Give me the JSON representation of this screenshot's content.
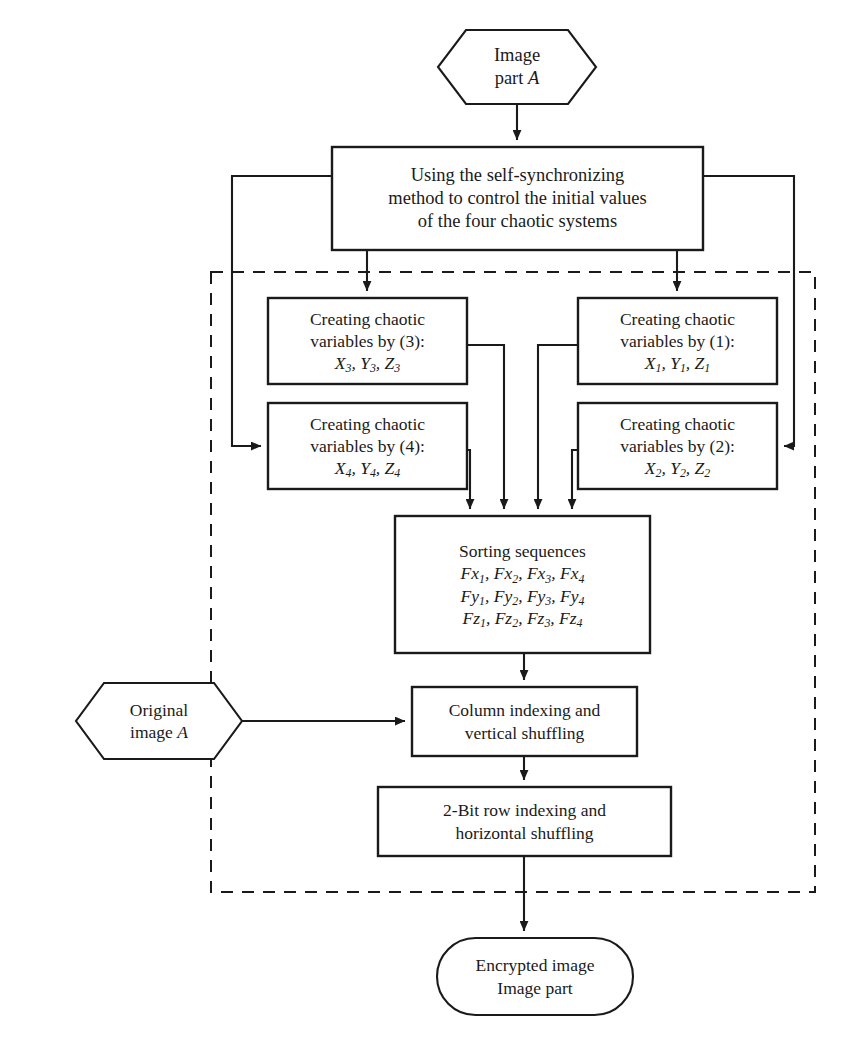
{
  "diagram": {
    "colors": {
      "stroke": "#1a1a1a",
      "background": "#ffffff",
      "dashed_region_stroke": "#1a1a1a"
    },
    "nodes": {
      "start_terminal": {
        "shape": "hexagon",
        "lines": [
          "Image",
          "part A"
        ],
        "line1": "Image",
        "line2_prefix": "part ",
        "line2_var": "A"
      },
      "sync_process": {
        "shape": "rectangle",
        "line1": "Using the self-synchronizing",
        "line2": "method to control the initial values",
        "line3": "of the four chaotic systems"
      },
      "chaotic_3": {
        "shape": "rectangle",
        "line1": "Creating chaotic",
        "line2": "variables by (3):",
        "vars": [
          "X",
          "Y",
          "Z"
        ],
        "index": "3"
      },
      "chaotic_1": {
        "shape": "rectangle",
        "line1": "Creating chaotic",
        "line2": "variables by (1):",
        "vars": [
          "X",
          "Y",
          "Z"
        ],
        "index": "1"
      },
      "chaotic_4": {
        "shape": "rectangle",
        "line1": "Creating chaotic",
        "line2": "variables by (4):",
        "vars": [
          "X",
          "Y",
          "Z"
        ],
        "index": "4"
      },
      "chaotic_2": {
        "shape": "rectangle",
        "line1": "Creating chaotic",
        "line2": "variables by (2):",
        "vars": [
          "X",
          "Y",
          "Z"
        ],
        "index": "2"
      },
      "sorting": {
        "shape": "rectangle",
        "heading": "Sorting sequences",
        "row_fx": {
          "prefix": "Fx",
          "indices": [
            "1",
            "2",
            "3",
            "4"
          ]
        },
        "row_fy": {
          "prefix": "Fy",
          "indices": [
            "1",
            "2",
            "3",
            "4"
          ]
        },
        "row_fz": {
          "prefix": "Fz",
          "indices": [
            "1",
            "2",
            "3",
            "4"
          ]
        }
      },
      "original_image": {
        "shape": "hexagon",
        "line1": "Original",
        "line2_prefix": "image ",
        "line2_var": "A"
      },
      "column_indexing": {
        "shape": "rectangle",
        "line1": "Column indexing and",
        "line2": "vertical shuffling"
      },
      "row_indexing": {
        "shape": "rectangle",
        "line1": "2-Bit row indexing and",
        "line2": "horizontal shuffling"
      },
      "end_terminal": {
        "shape": "rounded-rectangle",
        "line1": "Encrypted image",
        "line2": "Image part"
      }
    }
  }
}
